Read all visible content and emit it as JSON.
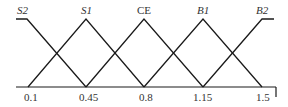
{
  "diagram": {
    "type": "fuzzy-membership-functions",
    "sets": [
      {
        "name": "S2",
        "italic": true,
        "shape": "left-shoulder",
        "peak": 0.1,
        "end": 0.45
      },
      {
        "name": "S1",
        "italic": true,
        "shape": "triangle",
        "start": 0.1,
        "peak": 0.45,
        "end": 0.8
      },
      {
        "name": "CE",
        "italic": false,
        "shape": "triangle",
        "start": 0.45,
        "peak": 0.8,
        "end": 1.15
      },
      {
        "name": "B1",
        "italic": true,
        "shape": "triangle",
        "start": 0.8,
        "peak": 1.15,
        "end": 1.5
      },
      {
        "name": "B2",
        "italic": true,
        "shape": "right-shoulder",
        "start": 1.15,
        "peak": 1.5
      }
    ],
    "x_ticks": [
      "0.1",
      "0.45",
      "0.8",
      "1.15",
      "1.5"
    ],
    "line_color": "#1a1a1a",
    "text_color": "#333333"
  }
}
